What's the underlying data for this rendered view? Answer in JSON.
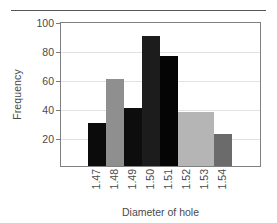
{
  "chart_data": {
    "type": "bar",
    "title": "",
    "subtitle": "",
    "xlabel": "Diameter of hole",
    "ylabel": "Frequency",
    "categories": [
      "1.47",
      "1.48",
      "1.49",
      "1.50",
      "1.51",
      "1.52",
      "1.53",
      "1.54"
    ],
    "values": [
      30,
      60,
      40,
      90,
      76,
      37,
      37,
      22
    ],
    "bar_colors": [
      "#0b0b0b",
      "#8f8f8f",
      "#0d0d0d",
      "#1c1c1c",
      "#050505",
      "#b5b5b5",
      "#b5b5b5",
      "#6b6b6b"
    ],
    "ylim": [
      0,
      100
    ],
    "yticks": [
      20,
      40,
      60,
      80,
      100
    ],
    "ytick_labels": [
      "20",
      "40",
      "60",
      "80",
      "100"
    ],
    "xtick_labels": [
      "1.47",
      "1.48",
      "1.49",
      "1.50",
      "1.51",
      "1.52",
      "1.53",
      "1.54"
    ],
    "grid": true,
    "grid_axis": "y",
    "legend": false,
    "legend_position": "none",
    "bar_gap": 0,
    "frame_color": "#808080",
    "grid_color": "#e2e2e2",
    "text_color": "#4a4a4a"
  },
  "decoration": {
    "top_rule": true,
    "top_rule_color": "#555555"
  }
}
